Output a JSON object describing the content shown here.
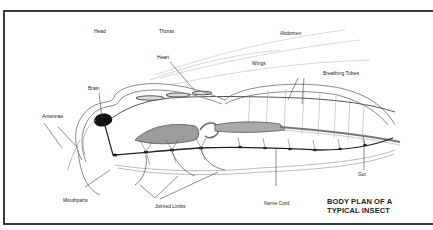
{
  "title": {
    "line1": "BODY PLAN OF A",
    "line2": "TYPICAL INSECT"
  },
  "labels": {
    "head": "Head",
    "thorax": "Thorax",
    "abdomen": "Abdomen",
    "heart": "Heart",
    "wings": "Wings",
    "breathing_tubes": "Breathing Tubes",
    "brain": "Brain",
    "antennae": "Antennae",
    "mouthparts": "Mouthparts",
    "jointed_limbs": "Jointed Limbs",
    "nerve_cord": "Nerve Cord",
    "gut": "Gut"
  },
  "colors": {
    "frame": "#3a3a3a",
    "ink": "#222222",
    "outline": "#9a9a9a",
    "shade": "#c8c8c8"
  }
}
